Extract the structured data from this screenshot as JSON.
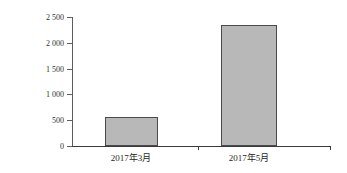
{
  "chart_data": {
    "type": "bar",
    "title": "",
    "xlabel": "",
    "ylabel": "生物量（g/m2）",
    "ylabel_text": "生物量（g/m",
    "ylabel_sup": "2",
    "ylabel_tail": "）",
    "categories": [
      "2017年3月",
      "2017年5月"
    ],
    "values": [
      560,
      2345
    ],
    "ylim": [
      0,
      2500
    ],
    "ytick_values": [
      0,
      500,
      1000,
      1500,
      2000,
      2500
    ],
    "ytick_labels": [
      "0",
      "500",
      "1 000",
      "1 500",
      "2 000",
      "2 500"
    ],
    "grid": false,
    "legend": null,
    "series": [
      {
        "name": "生物量",
        "values": [
          560,
          2345
        ],
        "fill_color": "#b8b8b8",
        "edge_color": "#4a4a4a"
      }
    ]
  },
  "colors": {
    "background": "#ffffff",
    "bar_fill": "#b8b8b8",
    "bar_edge": "#4a4a4a",
    "axis": "#3a3a3a",
    "text": "#1f1f1f"
  }
}
